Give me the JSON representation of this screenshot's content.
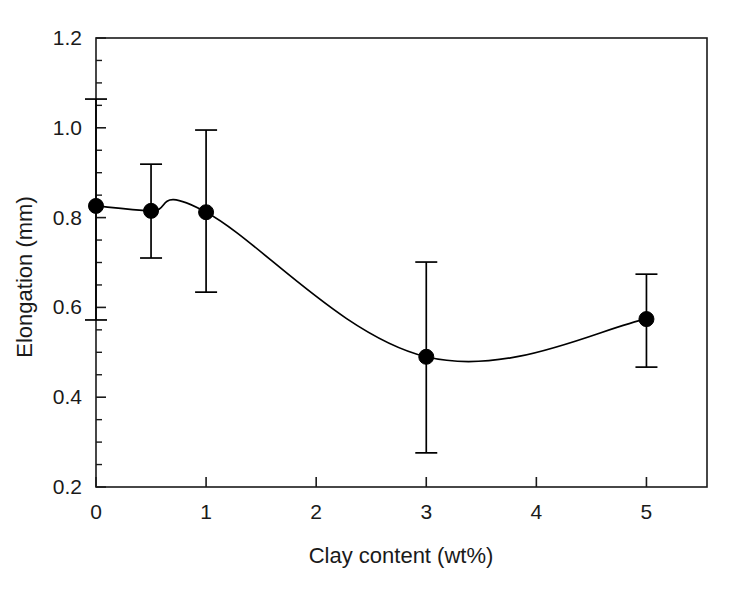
{
  "chart_data": {
    "type": "line",
    "title": "",
    "subtitle": "",
    "xlabel": "Clay content (wt%)",
    "ylabel": "Elongation (mm)",
    "xlim": [
      0,
      5.55
    ],
    "ylim": [
      0.2,
      1.2
    ],
    "grid": false,
    "legend": null,
    "legend_position": "none",
    "x_tick_labels": [
      "0",
      "1",
      "2",
      "3",
      "4",
      "5"
    ],
    "x_ticks": [
      0,
      1,
      2,
      3,
      4,
      5
    ],
    "x_minor_ticks": [],
    "y_tick_labels": [
      "0.2",
      "0.4",
      "0.6",
      "0.8",
      "1.0",
      "1.2"
    ],
    "y_ticks": [
      0.2,
      0.4,
      0.6,
      0.8,
      1.0,
      1.2
    ],
    "y_minor_ticks": [
      0.25,
      0.3,
      0.35,
      0.45,
      0.5,
      0.55,
      0.65,
      0.7,
      0.75,
      0.85,
      0.9,
      0.95,
      1.05,
      1.1,
      1.15
    ],
    "marker": "filled-circle",
    "marker_color": "#000000",
    "line_color": "#000000",
    "error_bar_color": "#000000",
    "error_bars": true,
    "series": [
      {
        "name": "Elongation",
        "x": [
          0,
          0.5,
          1,
          3,
          5
        ],
        "values": [
          0.826,
          0.815,
          0.812,
          0.49,
          0.574
        ],
        "err_low": [
          0.572,
          0.71,
          0.634,
          0.276,
          0.467
        ],
        "err_high": [
          1.064,
          0.919,
          0.995,
          0.701,
          0.674
        ]
      }
    ],
    "annotations": []
  },
  "figure": {
    "caption": "",
    "background_color": "#ffffff",
    "frame_color": "#1a1a1a"
  }
}
